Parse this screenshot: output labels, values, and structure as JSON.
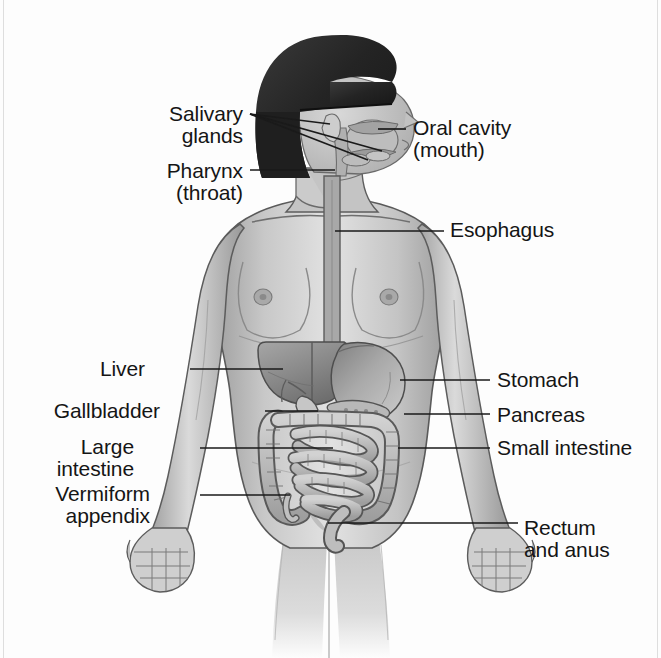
{
  "figure": {
    "type": "anatomical-diagram",
    "style": "grayscale medical illustration, halftone shading"
  },
  "colors": {
    "background": "#fdfdfd",
    "label_text": "#151515",
    "leader_line": "#1a1a1a",
    "hair_dark": "#2b2b2b",
    "skin_light": "#dcdcdc",
    "skin_mid": "#bdbdbd",
    "skin_shadow": "#9a9a9a",
    "outline": "#4a4a4a",
    "organ_light": "#cfcfcf",
    "organ_mid": "#a8a8a8",
    "organ_dark": "#7d7d7d",
    "liver_tone": "#8f8f8f",
    "stomach_tone": "#b5b5b5"
  },
  "labels": [
    {
      "id": "salivary-glands",
      "text": "Salivary\nglands",
      "side": "left",
      "x": 243,
      "y": 103,
      "align": "right"
    },
    {
      "id": "pharynx",
      "text": "Pharynx\n(throat)",
      "side": "left",
      "x": 243,
      "y": 160,
      "align": "right"
    },
    {
      "id": "oral-cavity",
      "text": "Oral cavity\n(mouth)",
      "side": "right",
      "x": 413,
      "y": 117,
      "align": "left"
    },
    {
      "id": "esophagus",
      "text": "Esophagus",
      "side": "right",
      "x": 450,
      "y": 219,
      "align": "left"
    },
    {
      "id": "liver",
      "text": "Liver",
      "side": "left",
      "x": 145,
      "y": 358,
      "align": "right"
    },
    {
      "id": "stomach",
      "text": "Stomach",
      "side": "right",
      "x": 497,
      "y": 369,
      "align": "left"
    },
    {
      "id": "gallbladder",
      "text": "Gallbladder",
      "side": "left",
      "x": 160,
      "y": 400,
      "align": "right"
    },
    {
      "id": "pancreas",
      "text": "Pancreas",
      "side": "right",
      "x": 497,
      "y": 404,
      "align": "left"
    },
    {
      "id": "large-intestine",
      "text": "Large\nintestine",
      "side": "left",
      "x": 134,
      "y": 436,
      "align": "right"
    },
    {
      "id": "small-intestine",
      "text": "Small intestine",
      "side": "right",
      "x": 497,
      "y": 437,
      "align": "left"
    },
    {
      "id": "vermiform-appendix",
      "text": "Vermiform\nappendix",
      "side": "left",
      "x": 150,
      "y": 483,
      "align": "right"
    },
    {
      "id": "rectum-and-anus",
      "text": "Rectum\nand anus",
      "side": "right",
      "x": 524,
      "y": 517,
      "align": "left"
    }
  ],
  "leader_lines": [
    {
      "id": "salivary-gland-parotid",
      "x1": 250,
      "y1": 114,
      "x2": 330,
      "y2": 124
    },
    {
      "id": "salivary-gland-submandibular",
      "x1": 250,
      "y1": 114,
      "x2": 382,
      "y2": 151
    },
    {
      "id": "salivary-gland-sublingual",
      "x1": 250,
      "y1": 114,
      "x2": 368,
      "y2": 160
    },
    {
      "id": "pharynx-leader",
      "x1": 250,
      "y1": 170,
      "x2": 335,
      "y2": 170
    },
    {
      "id": "oral-cavity-leader",
      "x1": 406,
      "y1": 129,
      "x2": 378,
      "y2": 129
    },
    {
      "id": "esophagus-leader",
      "x1": 444,
      "y1": 231,
      "x2": 335,
      "y2": 231
    },
    {
      "id": "liver-leader",
      "x1": 190,
      "y1": 369,
      "x2": 283,
      "y2": 369
    },
    {
      "id": "stomach-leader",
      "x1": 490,
      "y1": 380,
      "x2": 400,
      "y2": 380
    },
    {
      "id": "gallbladder-leader",
      "x1": 265,
      "y1": 411,
      "x2": 318,
      "y2": 411
    },
    {
      "id": "pancreas-leader",
      "x1": 490,
      "y1": 414,
      "x2": 404,
      "y2": 414
    },
    {
      "id": "large-intestine-leader",
      "x1": 200,
      "y1": 448,
      "x2": 333,
      "y2": 448
    },
    {
      "id": "small-intestine-leader",
      "x1": 490,
      "y1": 448,
      "x2": 398,
      "y2": 448
    },
    {
      "id": "vermiform-appendix-leader",
      "x1": 200,
      "y1": 495,
      "x2": 290,
      "y2": 495
    },
    {
      "id": "rectum-leader",
      "x1": 518,
      "y1": 523,
      "x2": 328,
      "y2": 523
    }
  ],
  "organs": [
    {
      "id": "oral-cavity",
      "name": "Oral cavity (mouth)"
    },
    {
      "id": "salivary-glands",
      "name": "Salivary glands"
    },
    {
      "id": "pharynx",
      "name": "Pharynx (throat)"
    },
    {
      "id": "esophagus",
      "name": "Esophagus"
    },
    {
      "id": "liver",
      "name": "Liver"
    },
    {
      "id": "gallbladder",
      "name": "Gallbladder"
    },
    {
      "id": "stomach",
      "name": "Stomach"
    },
    {
      "id": "pancreas",
      "name": "Pancreas"
    },
    {
      "id": "small-intestine",
      "name": "Small intestine"
    },
    {
      "id": "large-intestine",
      "name": "Large intestine"
    },
    {
      "id": "vermiform-appendix",
      "name": "Vermiform appendix"
    },
    {
      "id": "rectum-and-anus",
      "name": "Rectum and anus"
    }
  ]
}
